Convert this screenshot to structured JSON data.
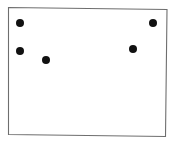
{
  "map": {
    "title": "Wyoming county distribution map",
    "region_name": "Wyoming",
    "state_outline_color": "#6e6e6e",
    "county_line_color": "#a8a8a8",
    "background_color": "#ffffff",
    "shaded_range": {
      "label": "northwest-range-shading",
      "color": "#8c8c8c",
      "halo_color": "#cfcfcf",
      "description": "Shaded gray area covering the northwest corner counties"
    },
    "dot_legend": {
      "label": "occurrence-record",
      "color": "#111111",
      "count": 5,
      "radius_px": 4
    },
    "occurrence_points": [
      {
        "name": "point-northwest-upper",
        "x": 20,
        "y": 23
      },
      {
        "name": "point-northwest-lower",
        "x": 20,
        "y": 51
      },
      {
        "name": "point-west-central",
        "x": 46,
        "y": 60
      },
      {
        "name": "point-east-central",
        "x": 133,
        "y": 49
      },
      {
        "name": "point-northeast",
        "x": 153,
        "y": 23
      }
    ]
  }
}
